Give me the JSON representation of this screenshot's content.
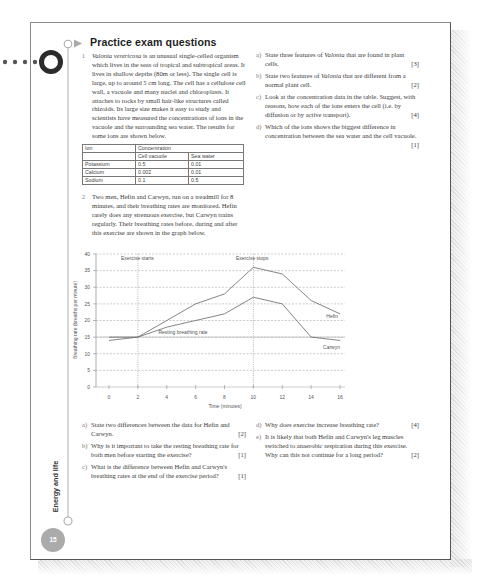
{
  "header": {
    "title": "Practice exam questions"
  },
  "sidebar": {
    "chapter": "Energy and life",
    "page_number": "15"
  },
  "q1": {
    "number": "1",
    "species": "Valonia ventricosa",
    "intro": " is an unusual single-celled organism which lives in the seas of tropical and subtropical areas. It lives in shallow depths (80m or less). The single cell is large, up to around 5 cm long. The cell has a cellulose cell wall, a vacuole and many nuclei and chloroplasts. It attaches to rocks by small hair-like structures called rhizoids. Its large size makes it easy to study and scientists have measured the concentrations of ions in the vacuole and the surrounding sea water. The results for some ions are shown below.",
    "table": {
      "header_ion": "Ion",
      "header_concentration": "Concentration",
      "sub_vacuole": "Cell vacuole",
      "sub_sea": "Sea water",
      "rows": [
        {
          "ion": "Potassium",
          "vacuole": "0.5",
          "sea": "0.01"
        },
        {
          "ion": "Calcium",
          "vacuole": "0.002",
          "sea": "0.01"
        },
        {
          "ion": "Sodium",
          "vacuole": "0.1",
          "sea": "0.5"
        }
      ]
    },
    "parts": [
      {
        "label": "a)",
        "pre": "State three features of ",
        "em": "Valonia",
        "post": " that are found in plant cells.",
        "marks": "[3]"
      },
      {
        "label": "b)",
        "pre": "State two features of ",
        "em": "Valonia",
        "post": " that are different from a normal plant cell.",
        "marks": "[2]"
      },
      {
        "label": "c)",
        "pre": "Look at the concentration data in the table. Suggest, with reasons, how each of the ions enters the cell (i.e. by diffusion or by active transport).",
        "em": "",
        "post": "",
        "marks": "[4]"
      },
      {
        "label": "d)",
        "pre": "Which of the ions shows the biggest difference in concentration between the sea water and the cell vacuole.",
        "em": "",
        "post": "",
        "marks": "[1]"
      }
    ]
  },
  "q2": {
    "number": "2",
    "intro": "Two men, Hefin and Carwyn, run on a treadmill for 8 minutes, and their breathing rates are monitored. Hefin rarely does any strenuous exercise, but Carwyn trains regularly. Their breathing rates before, during and after this exercise are shown in the graph below.",
    "parts": [
      {
        "label": "a)",
        "text": "State two differences between the data for Hefin and Carwyn.",
        "marks": "[2]"
      },
      {
        "label": "b)",
        "text": "Why is it important to take the resting breathing rate for both men before starting the exercise?",
        "marks": "[1]"
      },
      {
        "label": "c)",
        "text": "What is the difference between Hefin and Carwyn's breathing rates at the end of the exercise period?",
        "marks": "[1]"
      },
      {
        "label": "d)",
        "text": "Why does exercise increase breathing rate?",
        "marks": "[4]"
      },
      {
        "label": "e)",
        "text": "It is likely that both Hefin and Carwyn's leg muscles switched to anaerobic respiration during this exercise. Why can this not continue for a long period?",
        "marks": "[2]"
      }
    ]
  },
  "chart_data": {
    "type": "line",
    "title": "",
    "xlabel": "Time (minutes)",
    "ylabel": "Breathing rate (breaths per minute)",
    "x": [
      0,
      2,
      4,
      6,
      8,
      10,
      12,
      14,
      16
    ],
    "xticks": [
      "0",
      "2",
      "4",
      "6",
      "8",
      "10",
      "12",
      "14",
      "16"
    ],
    "yticks": [
      "0",
      "5",
      "10",
      "15",
      "20",
      "25",
      "30",
      "35",
      "40"
    ],
    "xlim": [
      0,
      16
    ],
    "ylim": [
      0,
      40
    ],
    "grid": true,
    "series": [
      {
        "name": "Hefin",
        "values": [
          15,
          15,
          20,
          25,
          28,
          36,
          34,
          26,
          22
        ]
      },
      {
        "name": "Carwyn",
        "values": [
          14,
          15,
          18,
          20,
          22,
          27,
          25,
          15,
          14
        ]
      }
    ],
    "reference_line": {
      "label": "Resting breathing rate",
      "y": 15
    },
    "annotations": [
      {
        "label": "Exercise starts",
        "x": 2
      },
      {
        "label": "Exercise stops",
        "x": 10
      }
    ]
  }
}
